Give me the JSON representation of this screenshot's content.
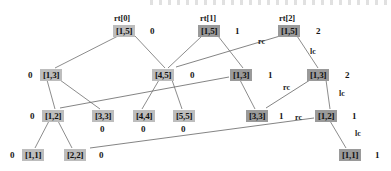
{
  "figure": {
    "type": "persistent-segment-tree-diagram",
    "colors": {
      "node_fill": "#bdbdbd",
      "node_fill_dark": "#9a9a9a",
      "edge": "#6e6e6e",
      "text": "#111111",
      "background": "#ffffff"
    },
    "root_labels": [
      {
        "id": "rt0",
        "text": "rt[0]",
        "x": 114,
        "y": 14
      },
      {
        "id": "rt1",
        "text": "rt[1]",
        "x": 200,
        "y": 14
      },
      {
        "id": "rt2",
        "text": "rt[2]",
        "x": 279,
        "y": 14
      }
    ],
    "nodes": [
      {
        "id": "r0n0",
        "text": "[1,5]",
        "x": 113,
        "y": 25,
        "dark": false
      },
      {
        "id": "r0n1",
        "text": "[1,5]",
        "x": 198,
        "y": 25,
        "dark": true
      },
      {
        "id": "r0n2",
        "text": "[1,5]",
        "x": 278,
        "y": 25,
        "dark": true
      },
      {
        "id": "r1n0",
        "text": "[1,3]",
        "x": 40,
        "y": 69,
        "dark": false
      },
      {
        "id": "r1n1",
        "text": "[4,5]",
        "x": 152,
        "y": 69,
        "dark": false
      },
      {
        "id": "r1n2",
        "text": "[1,3]",
        "x": 230,
        "y": 69,
        "dark": true
      },
      {
        "id": "r1n3",
        "text": "[1,3]",
        "x": 307,
        "y": 69,
        "dark": true
      },
      {
        "id": "r2n0",
        "text": "[1,2]",
        "x": 42,
        "y": 110,
        "dark": false
      },
      {
        "id": "r2n1",
        "text": "[3,3]",
        "x": 92,
        "y": 110,
        "dark": false
      },
      {
        "id": "r2n2",
        "text": "[4,4]",
        "x": 133,
        "y": 110,
        "dark": false
      },
      {
        "id": "r2n3",
        "text": "[5,5]",
        "x": 173,
        "y": 110,
        "dark": false
      },
      {
        "id": "r2n4",
        "text": "[3,3]",
        "x": 246,
        "y": 110,
        "dark": true
      },
      {
        "id": "r2n5",
        "text": "[1,2]",
        "x": 315,
        "y": 110,
        "dark": true
      },
      {
        "id": "r3n0",
        "text": "[1,1]",
        "x": 22,
        "y": 149,
        "dark": false
      },
      {
        "id": "r3n1",
        "text": "[2,2]",
        "x": 64,
        "y": 149,
        "dark": false
      },
      {
        "id": "r3n2",
        "text": "[1,1]",
        "x": 339,
        "y": 149,
        "dark": true
      }
    ],
    "version_numbers": [
      {
        "id": "v-r0n0",
        "text": "0",
        "x": 150,
        "y": 26
      },
      {
        "id": "v-r0n1",
        "text": "1",
        "x": 235,
        "y": 26
      },
      {
        "id": "v-r0n2",
        "text": "2",
        "x": 316,
        "y": 26
      },
      {
        "id": "v-r1n0",
        "text": "0",
        "x": 28,
        "y": 70
      },
      {
        "id": "v-r1n1",
        "text": "0",
        "x": 190,
        "y": 70
      },
      {
        "id": "v-r1n2",
        "text": "1",
        "x": 268,
        "y": 70
      },
      {
        "id": "v-r1n3",
        "text": "2",
        "x": 345,
        "y": 70
      },
      {
        "id": "v-r2n0",
        "text": "0",
        "x": 30,
        "y": 111
      },
      {
        "id": "v-r2n1",
        "text": "0",
        "x": 100,
        "y": 124
      },
      {
        "id": "v-r2n2",
        "text": "0",
        "x": 141,
        "y": 124
      },
      {
        "id": "v-r2n3",
        "text": "0",
        "x": 181,
        "y": 124
      },
      {
        "id": "v-r2n4",
        "text": "1",
        "x": 279,
        "y": 111
      },
      {
        "id": "v-r2n5",
        "text": "1",
        "x": 352,
        "y": 111
      },
      {
        "id": "v-r3n0",
        "text": "0",
        "x": 10,
        "y": 150
      },
      {
        "id": "v-r3n1",
        "text": "0",
        "x": 99,
        "y": 150
      },
      {
        "id": "v-r3n2",
        "text": "1",
        "x": 375,
        "y": 150
      }
    ],
    "edge_labels": [
      {
        "id": "e-rc-root",
        "text": "rc",
        "x": 258,
        "y": 38
      },
      {
        "id": "e-lc-root",
        "text": "lc",
        "x": 310,
        "y": 48
      },
      {
        "id": "e-rc-mid",
        "text": "rc",
        "x": 283,
        "y": 84
      },
      {
        "id": "e-lc-mid",
        "text": "lc",
        "x": 339,
        "y": 90
      },
      {
        "id": "e-rc-low",
        "text": "rc",
        "x": 295,
        "y": 114
      },
      {
        "id": "e-lc-low",
        "text": "lc",
        "x": 355,
        "y": 130
      }
    ],
    "edges": [
      {
        "id": "edge-r0n0-r1n0",
        "from": "r0n0",
        "to": "r1n0",
        "x1": 118,
        "y1": 36,
        "x2": 55,
        "y2": 68,
        "thick": false
      },
      {
        "id": "edge-r0n0-r1n1",
        "from": "r0n0",
        "to": "r1n1",
        "x1": 135,
        "y1": 36,
        "x2": 165,
        "y2": 68,
        "thick": false
      },
      {
        "id": "edge-r0n1-r1n1",
        "from": "r0n1",
        "to": "r1n1",
        "x1": 202,
        "y1": 36,
        "x2": 168,
        "y2": 68,
        "thick": false
      },
      {
        "id": "edge-r0n1-r1n2",
        "from": "r0n1",
        "to": "r1n2",
        "x1": 218,
        "y1": 36,
        "x2": 243,
        "y2": 68,
        "thick": false
      },
      {
        "id": "edge-r0n2-r1n1-rc",
        "from": "r0n2",
        "to": "r1n1",
        "x1": 280,
        "y1": 36,
        "x2": 176,
        "y2": 67,
        "thick": true
      },
      {
        "id": "edge-r0n2-r1n3-lc",
        "from": "r0n2",
        "to": "r1n3",
        "x1": 297,
        "y1": 36,
        "x2": 318,
        "y2": 68,
        "thick": false
      },
      {
        "id": "edge-r1n0-r2n0",
        "from": "r1n0",
        "to": "r2n0",
        "x1": 47,
        "y1": 80,
        "x2": 55,
        "y2": 109,
        "thick": false
      },
      {
        "id": "edge-r1n0-r2n1",
        "from": "r1n0",
        "to": "r2n1",
        "x1": 60,
        "y1": 80,
        "x2": 100,
        "y2": 109,
        "thick": false
      },
      {
        "id": "edge-r1n1-r2n2",
        "from": "r1n1",
        "to": "r2n2",
        "x1": 159,
        "y1": 80,
        "x2": 142,
        "y2": 109,
        "thick": false
      },
      {
        "id": "edge-r1n1-r2n3",
        "from": "r1n1",
        "to": "r2n3",
        "x1": 172,
        "y1": 80,
        "x2": 182,
        "y2": 109,
        "thick": false
      },
      {
        "id": "edge-r1n2-r2n4",
        "from": "r1n2",
        "to": "r2n4",
        "x1": 240,
        "y1": 80,
        "x2": 255,
        "y2": 109,
        "thick": false
      },
      {
        "id": "edge-r1n2-r2n0-rc",
        "from": "r1n2",
        "to": "r2n0",
        "x1": 229,
        "y1": 77,
        "x2": 60,
        "y2": 108,
        "thick": true
      },
      {
        "id": "edge-r1n3-r2n4-rc",
        "from": "r1n3",
        "to": "r2n4",
        "x1": 310,
        "y1": 80,
        "x2": 266,
        "y2": 108,
        "thick": true
      },
      {
        "id": "edge-r1n3-r2n5-lc",
        "from": "r1n3",
        "to": "r2n5",
        "x1": 326,
        "y1": 80,
        "x2": 330,
        "y2": 109,
        "thick": false
      },
      {
        "id": "edge-r2n0-r3n0",
        "from": "r2n0",
        "to": "r3n0",
        "x1": 49,
        "y1": 121,
        "x2": 35,
        "y2": 148,
        "thick": false
      },
      {
        "id": "edge-r2n0-r3n1",
        "from": "r2n0",
        "to": "r3n1",
        "x1": 58,
        "y1": 121,
        "x2": 72,
        "y2": 148,
        "thick": false
      },
      {
        "id": "edge-r2n5-r3n1-rc",
        "from": "r2n5",
        "to": "r3n1",
        "x1": 314,
        "y1": 118,
        "x2": 90,
        "y2": 148,
        "thick": true
      },
      {
        "id": "edge-r2n5-r3n2-lc",
        "from": "r2n5",
        "to": "r3n2",
        "x1": 330,
        "y1": 121,
        "x2": 346,
        "y2": 148,
        "thick": false
      }
    ]
  }
}
